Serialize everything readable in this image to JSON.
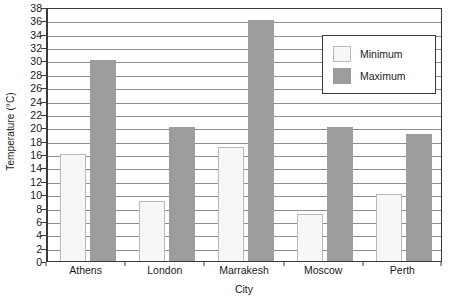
{
  "chart_data": {
    "type": "bar",
    "title": "",
    "xlabel": "City",
    "ylabel": "Temperature (°C)",
    "categories": [
      "Athens",
      "London",
      "Marrakesh",
      "Moscow",
      "Perth"
    ],
    "series": [
      {
        "name": "Minimum",
        "values": [
          16,
          9,
          17,
          7,
          10
        ],
        "color": "#f7f7f5"
      },
      {
        "name": "Maximum",
        "values": [
          30,
          20,
          36,
          20,
          19
        ],
        "color": "#9d9d9d"
      }
    ],
    "ylim": [
      0,
      38
    ],
    "ytick_step": 2,
    "yticks": [
      0,
      2,
      4,
      6,
      8,
      10,
      12,
      14,
      16,
      18,
      20,
      22,
      24,
      26,
      28,
      30,
      32,
      34,
      36,
      38
    ],
    "ytick_labels": [
      "0",
      "2",
      "4",
      "6",
      "8",
      "10",
      "12",
      "14",
      "16",
      "18",
      "20",
      "22",
      "24",
      "26",
      "28",
      "30",
      "32",
      "34",
      "36",
      "38"
    ],
    "grid": true,
    "grid_axis": "y",
    "legend_position": "top-right",
    "legend_entries": [
      "Minimum",
      "Maximum"
    ]
  }
}
